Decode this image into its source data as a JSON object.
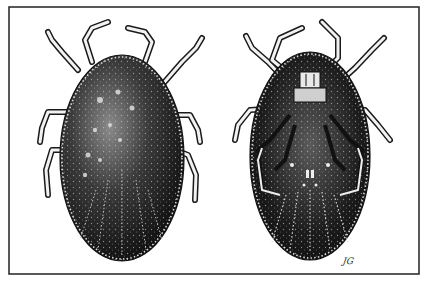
{
  "figure": {
    "views": [
      {
        "name": "dorsal view",
        "side": "left"
      },
      {
        "name": "ventral view",
        "side": "right"
      }
    ],
    "signature": "JG",
    "colors": {
      "ink": "#111111",
      "paper": "#ffffff",
      "frame": "#222222",
      "stipple": "#9a9a9a"
    }
  }
}
